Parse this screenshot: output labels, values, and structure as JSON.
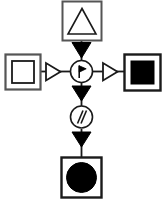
{
  "diagram": {
    "title": "Cross-shaped process flow diagram",
    "background_color": "#ffffff",
    "stroke_color": "#1a1a1a",
    "fill_color": "#000000",
    "shape_fill": "#ffffff",
    "canvas": {
      "width": 166,
      "height": 211
    },
    "nodes": [
      {
        "id": "top",
        "name": "top-node",
        "shape": "square-with-outlined-triangle",
        "label": "",
        "inner_symbol": "triangle-outline",
        "x": 62,
        "y": 1,
        "w": 40,
        "h": 40
      },
      {
        "id": "left",
        "name": "left-node",
        "shape": "square-with-inner-square",
        "label": "",
        "inner_symbol": "square-outline",
        "x": 5,
        "y": 54,
        "w": 36,
        "h": 36
      },
      {
        "id": "center",
        "name": "center-node",
        "shape": "circle-with-flag",
        "label": "",
        "inner_symbol": "flag-glyph",
        "cx": 81,
        "cy": 71,
        "r": 11
      },
      {
        "id": "right",
        "name": "right-node",
        "shape": "square-with-filled-square",
        "label": "",
        "inner_symbol": "square-filled",
        "x": 124,
        "y": 54,
        "w": 37,
        "h": 37
      },
      {
        "id": "middle",
        "name": "middle-node",
        "shape": "circle-with-double-slash",
        "label": "",
        "inner_symbol": "double-slash-glyph",
        "cx": 81,
        "cy": 117,
        "r": 11
      },
      {
        "id": "bottom",
        "name": "bottom-node",
        "shape": "square-with-filled-circle",
        "label": "",
        "inner_symbol": "circle-filled",
        "x": 61,
        "y": 157,
        "w": 41,
        "h": 41
      }
    ],
    "connectors": [
      {
        "id": "c1",
        "name": "connector-top-to-center",
        "from": "top",
        "to": "center",
        "orientation": "vertical",
        "arrowhead": "filled-triangle-down",
        "label": ""
      },
      {
        "id": "c2",
        "name": "connector-left-to-center",
        "from": "left",
        "to": "center",
        "orientation": "horizontal",
        "arrowhead": "outlined-triangle-right",
        "label": ""
      },
      {
        "id": "c3",
        "name": "connector-center-to-right",
        "from": "center",
        "to": "right",
        "orientation": "horizontal",
        "arrowhead": "outlined-triangle-right",
        "label": ""
      },
      {
        "id": "c4",
        "name": "connector-center-to-middle",
        "from": "center",
        "to": "middle",
        "orientation": "vertical",
        "arrowhead": "filled-triangle-down",
        "label": ""
      },
      {
        "id": "c5",
        "name": "connector-middle-to-bottom",
        "from": "middle",
        "to": "bottom",
        "orientation": "vertical",
        "arrowhead": "filled-triangle-down",
        "label": ""
      }
    ]
  }
}
